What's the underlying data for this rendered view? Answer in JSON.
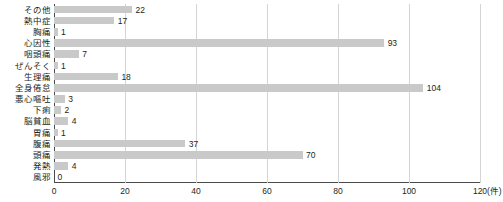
{
  "chart_data": {
    "type": "bar",
    "orientation": "horizontal",
    "title": "",
    "xlabel": "(件)",
    "ylabel": "",
    "xlim": [
      0,
      120
    ],
    "xticks": [
      0,
      20,
      40,
      60,
      80,
      100,
      120
    ],
    "grid": true,
    "legend": false,
    "bar_color": "#c9c9c9",
    "axis_color": "#4a4a4a",
    "grid_color": "#d4d4d4",
    "unit_suffix": "(件)",
    "categories": [
      "その他",
      "熱中症",
      "胸痛",
      "心因性",
      "咽頭痛",
      "ぜんそく",
      "生理痛",
      "全身倦怠",
      "悪心嘔吐",
      "下痢",
      "脳貧血",
      "胃痛",
      "腹痛",
      "頭痛",
      "発熱",
      "風邪"
    ],
    "values": [
      22,
      17,
      1,
      93,
      7,
      1,
      18,
      104,
      3,
      2,
      4,
      1,
      37,
      70,
      4,
      0
    ],
    "value_labels": [
      "22",
      "17",
      "1",
      "93",
      "7",
      "1",
      "18",
      "104",
      "3",
      "2",
      "4",
      "1",
      "37",
      "70",
      "4",
      "0"
    ]
  }
}
